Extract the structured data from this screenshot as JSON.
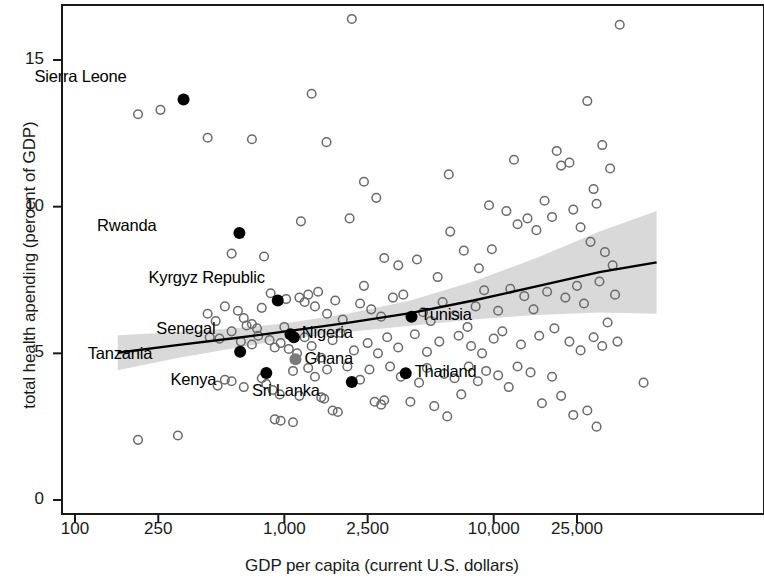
{
  "chart_data": {
    "type": "scatter",
    "title": "",
    "xlabel": "GDP per capita (current U.S. dollars)",
    "ylabel": "total health apending (percent of GDP)",
    "xscale": "log",
    "yscale": "linear",
    "xlim": [
      130,
      60000
    ],
    "ylim": [
      0,
      17.4
    ],
    "xticks": [
      100,
      250,
      1000,
      2500,
      10000,
      25000
    ],
    "xtick_labels": [
      "100",
      "250",
      "1,000",
      "2,500",
      "10,000",
      "25,000"
    ],
    "yticks": [
      0,
      5,
      10,
      15
    ],
    "ytick_labels": [
      "0",
      "5",
      "10",
      "15"
    ],
    "grid": false,
    "legend": "none",
    "colors": {
      "highlight_point": "#000000",
      "other_point_stroke": "#6a6a6a",
      "ghana_point": "#7a7a7a",
      "trend_line": "#000000",
      "confidence_band": "#d9d9d9",
      "axis": "#1a1a1a"
    },
    "series": [
      {
        "name": "highlighted countries",
        "marker": "filled-circle",
        "points": [
          {
            "label": "Sierra Leone",
            "x": 330,
            "y": 13.65,
            "label_dx": -57,
            "label_dy": -22
          },
          {
            "label": "Rwanda",
            "x": 610,
            "y": 9.1,
            "label_dx": -83,
            "label_dy": -6
          },
          {
            "label": "Kyrgyz Republic",
            "x": 930,
            "y": 6.8,
            "label_dx": -13,
            "label_dy": -22
          },
          {
            "label": "Senegal",
            "x": 1070,
            "y": 5.65,
            "label_dx": -75,
            "label_dy": -4
          },
          {
            "label": "Nigeria",
            "x": 1110,
            "y": 5.55,
            "label_dx": 8,
            "label_dy": -3
          },
          {
            "label": "Tanzania",
            "x": 615,
            "y": 5.05,
            "label_dx": -88,
            "label_dy": 3
          },
          {
            "label": "Ghana",
            "x": 1130,
            "y": 4.8,
            "label_dx": 9,
            "label_dy": 1,
            "fill": "gray"
          },
          {
            "label": "Kenya",
            "x": 820,
            "y": 4.33,
            "label_dx": -50,
            "label_dy": 8
          },
          {
            "label": "Sri Lanka",
            "x": 2100,
            "y": 4.02,
            "label_dx": -32,
            "label_dy": 10
          },
          {
            "label": "Tunisia",
            "x": 4050,
            "y": 6.25,
            "label_dx": 9,
            "label_dy": -1
          },
          {
            "label": "Thailand",
            "x": 3800,
            "y": 4.32,
            "label_dx": 9,
            "label_dy": 0
          }
        ]
      },
      {
        "name": "other countries",
        "marker": "open-circle",
        "points": [
          {
            "x": 200,
            "y": 13.15
          },
          {
            "x": 256,
            "y": 13.3
          },
          {
            "x": 430,
            "y": 12.35
          },
          {
            "x": 700,
            "y": 12.3
          },
          {
            "x": 1350,
            "y": 13.85
          },
          {
            "x": 1590,
            "y": 12.2
          },
          {
            "x": 2100,
            "y": 16.4
          },
          {
            "x": 2400,
            "y": 10.85
          },
          {
            "x": 2750,
            "y": 10.3
          },
          {
            "x": 6100,
            "y": 11.1
          },
          {
            "x": 9500,
            "y": 10.05
          },
          {
            "x": 12500,
            "y": 11.6
          },
          {
            "x": 20000,
            "y": 11.9
          },
          {
            "x": 21000,
            "y": 11.4
          },
          {
            "x": 23000,
            "y": 11.5
          },
          {
            "x": 28000,
            "y": 13.6
          },
          {
            "x": 30000,
            "y": 10.6
          },
          {
            "x": 31000,
            "y": 10.1
          },
          {
            "x": 33000,
            "y": 12.1
          },
          {
            "x": 36000,
            "y": 11.3
          },
          {
            "x": 40000,
            "y": 16.2
          },
          {
            "x": 560,
            "y": 8.4
          },
          {
            "x": 800,
            "y": 8.3
          },
          {
            "x": 1200,
            "y": 9.5
          },
          {
            "x": 1450,
            "y": 7.1
          },
          {
            "x": 2050,
            "y": 9.6
          },
          {
            "x": 2400,
            "y": 7.3
          },
          {
            "x": 3000,
            "y": 8.25
          },
          {
            "x": 3500,
            "y": 8.0
          },
          {
            "x": 4300,
            "y": 8.2
          },
          {
            "x": 5400,
            "y": 7.6
          },
          {
            "x": 6200,
            "y": 9.15
          },
          {
            "x": 7200,
            "y": 8.5
          },
          {
            "x": 8500,
            "y": 7.9
          },
          {
            "x": 9800,
            "y": 8.55
          },
          {
            "x": 11500,
            "y": 9.85
          },
          {
            "x": 13000,
            "y": 9.4
          },
          {
            "x": 14500,
            "y": 9.6
          },
          {
            "x": 16000,
            "y": 9.2
          },
          {
            "x": 17500,
            "y": 10.2
          },
          {
            "x": 19000,
            "y": 9.65
          },
          {
            "x": 24000,
            "y": 9.9
          },
          {
            "x": 26000,
            "y": 9.3
          },
          {
            "x": 29000,
            "y": 8.8
          },
          {
            "x": 34000,
            "y": 8.45
          },
          {
            "x": 37000,
            "y": 8.0
          },
          {
            "x": 430,
            "y": 6.35
          },
          {
            "x": 470,
            "y": 6.1
          },
          {
            "x": 520,
            "y": 6.6
          },
          {
            "x": 600,
            "y": 6.45
          },
          {
            "x": 640,
            "y": 6.2
          },
          {
            "x": 660,
            "y": 5.95
          },
          {
            "x": 700,
            "y": 6.0
          },
          {
            "x": 740,
            "y": 5.85
          },
          {
            "x": 780,
            "y": 6.55
          },
          {
            "x": 860,
            "y": 7.05
          },
          {
            "x": 1020,
            "y": 6.85
          },
          {
            "x": 1180,
            "y": 6.9
          },
          {
            "x": 1250,
            "y": 6.75
          },
          {
            "x": 1300,
            "y": 7.0
          },
          {
            "x": 1400,
            "y": 6.6
          },
          {
            "x": 1600,
            "y": 6.35
          },
          {
            "x": 1750,
            "y": 6.8
          },
          {
            "x": 1900,
            "y": 6.15
          },
          {
            "x": 2300,
            "y": 6.7
          },
          {
            "x": 2600,
            "y": 6.5
          },
          {
            "x": 2900,
            "y": 6.25
          },
          {
            "x": 3300,
            "y": 6.9
          },
          {
            "x": 3700,
            "y": 7.0
          },
          {
            "x": 4600,
            "y": 6.4
          },
          {
            "x": 5000,
            "y": 6.1
          },
          {
            "x": 5700,
            "y": 6.75
          },
          {
            "x": 6500,
            "y": 6.3
          },
          {
            "x": 7500,
            "y": 5.9
          },
          {
            "x": 8200,
            "y": 6.6
          },
          {
            "x": 9000,
            "y": 7.15
          },
          {
            "x": 10500,
            "y": 6.45
          },
          {
            "x": 12000,
            "y": 7.2
          },
          {
            "x": 14000,
            "y": 6.95
          },
          {
            "x": 15500,
            "y": 6.5
          },
          {
            "x": 18000,
            "y": 7.1
          },
          {
            "x": 22000,
            "y": 6.9
          },
          {
            "x": 25000,
            "y": 7.3
          },
          {
            "x": 27000,
            "y": 6.7
          },
          {
            "x": 32000,
            "y": 7.45
          },
          {
            "x": 35000,
            "y": 6.05
          },
          {
            "x": 38000,
            "y": 7.0
          },
          {
            "x": 440,
            "y": 5.55
          },
          {
            "x": 490,
            "y": 5.5
          },
          {
            "x": 560,
            "y": 5.75
          },
          {
            "x": 620,
            "y": 5.4
          },
          {
            "x": 700,
            "y": 5.3
          },
          {
            "x": 750,
            "y": 5.6
          },
          {
            "x": 850,
            "y": 5.45
          },
          {
            "x": 900,
            "y": 5.2
          },
          {
            "x": 960,
            "y": 5.35
          },
          {
            "x": 1000,
            "y": 5.9
          },
          {
            "x": 1050,
            "y": 5.15
          },
          {
            "x": 1150,
            "y": 5.0
          },
          {
            "x": 1250,
            "y": 5.55
          },
          {
            "x": 1350,
            "y": 5.25
          },
          {
            "x": 1500,
            "y": 4.85
          },
          {
            "x": 1700,
            "y": 5.45
          },
          {
            "x": 1850,
            "y": 5.7
          },
          {
            "x": 2150,
            "y": 5.1
          },
          {
            "x": 2500,
            "y": 5.35
          },
          {
            "x": 2800,
            "y": 5.0
          },
          {
            "x": 3100,
            "y": 5.55
          },
          {
            "x": 3500,
            "y": 5.2
          },
          {
            "x": 4200,
            "y": 5.65
          },
          {
            "x": 4800,
            "y": 5.05
          },
          {
            "x": 5500,
            "y": 5.4
          },
          {
            "x": 6800,
            "y": 5.6
          },
          {
            "x": 7800,
            "y": 5.25
          },
          {
            "x": 8800,
            "y": 5.0
          },
          {
            "x": 10000,
            "y": 5.5
          },
          {
            "x": 11000,
            "y": 5.75
          },
          {
            "x": 13500,
            "y": 5.3
          },
          {
            "x": 16500,
            "y": 5.6
          },
          {
            "x": 19500,
            "y": 5.85
          },
          {
            "x": 23000,
            "y": 5.4
          },
          {
            "x": 26000,
            "y": 5.1
          },
          {
            "x": 30000,
            "y": 5.55
          },
          {
            "x": 33000,
            "y": 5.25
          },
          {
            "x": 39000,
            "y": 5.4
          },
          {
            "x": 780,
            "y": 4.15
          },
          {
            "x": 820,
            "y": 3.95
          },
          {
            "x": 880,
            "y": 3.75
          },
          {
            "x": 950,
            "y": 3.6
          },
          {
            "x": 1100,
            "y": 4.4
          },
          {
            "x": 1180,
            "y": 3.55
          },
          {
            "x": 1300,
            "y": 4.5
          },
          {
            "x": 1400,
            "y": 4.2
          },
          {
            "x": 1500,
            "y": 3.5
          },
          {
            "x": 1600,
            "y": 4.45
          },
          {
            "x": 1700,
            "y": 3.05
          },
          {
            "x": 1800,
            "y": 3.0
          },
          {
            "x": 2000,
            "y": 4.55
          },
          {
            "x": 2300,
            "y": 4.1
          },
          {
            "x": 2550,
            "y": 4.45
          },
          {
            "x": 2700,
            "y": 3.35
          },
          {
            "x": 3000,
            "y": 3.4
          },
          {
            "x": 3200,
            "y": 4.55
          },
          {
            "x": 3600,
            "y": 4.2
          },
          {
            "x": 4000,
            "y": 3.35
          },
          {
            "x": 4400,
            "y": 4.0
          },
          {
            "x": 4800,
            "y": 4.5
          },
          {
            "x": 5200,
            "y": 3.2
          },
          {
            "x": 5800,
            "y": 4.3
          },
          {
            "x": 6500,
            "y": 4.15
          },
          {
            "x": 7000,
            "y": 3.6
          },
          {
            "x": 7600,
            "y": 4.55
          },
          {
            "x": 8400,
            "y": 4.05
          },
          {
            "x": 9200,
            "y": 4.4
          },
          {
            "x": 10500,
            "y": 4.25
          },
          {
            "x": 11800,
            "y": 3.85
          },
          {
            "x": 13000,
            "y": 4.55
          },
          {
            "x": 15000,
            "y": 4.35
          },
          {
            "x": 17000,
            "y": 3.3
          },
          {
            "x": 19000,
            "y": 4.2
          },
          {
            "x": 21000,
            "y": 3.55
          },
          {
            "x": 24000,
            "y": 2.9
          },
          {
            "x": 28000,
            "y": 3.05
          },
          {
            "x": 31000,
            "y": 2.5
          },
          {
            "x": 52000,
            "y": 4.0
          },
          {
            "x": 200,
            "y": 2.05
          },
          {
            "x": 310,
            "y": 2.2
          },
          {
            "x": 480,
            "y": 3.9
          },
          {
            "x": 520,
            "y": 4.1
          },
          {
            "x": 560,
            "y": 4.05
          },
          {
            "x": 640,
            "y": 3.85
          },
          {
            "x": 900,
            "y": 2.75
          },
          {
            "x": 960,
            "y": 2.7
          },
          {
            "x": 1100,
            "y": 2.65
          },
          {
            "x": 1550,
            "y": 3.45
          },
          {
            "x": 2900,
            "y": 3.25
          },
          {
            "x": 6000,
            "y": 2.85
          }
        ]
      }
    ],
    "trend_line": {
      "name": "fitted trend",
      "points": [
        {
          "x": 160,
          "y": 5.02
        },
        {
          "x": 300,
          "y": 5.27
        },
        {
          "x": 600,
          "y": 5.53
        },
        {
          "x": 1000,
          "y": 5.74
        },
        {
          "x": 2000,
          "y": 6.04
        },
        {
          "x": 4000,
          "y": 6.37
        },
        {
          "x": 8000,
          "y": 6.8
        },
        {
          "x": 16000,
          "y": 7.28
        },
        {
          "x": 32000,
          "y": 7.77
        },
        {
          "x": 60000,
          "y": 8.1
        }
      ]
    },
    "confidence_band": {
      "name": "confidence interval",
      "upper": [
        {
          "x": 160,
          "y": 5.62
        },
        {
          "x": 300,
          "y": 5.72
        },
        {
          "x": 600,
          "y": 5.86
        },
        {
          "x": 1000,
          "y": 6.02
        },
        {
          "x": 2000,
          "y": 6.35
        },
        {
          "x": 4000,
          "y": 6.8
        },
        {
          "x": 8000,
          "y": 7.45
        },
        {
          "x": 16000,
          "y": 8.25
        },
        {
          "x": 32000,
          "y": 9.15
        },
        {
          "x": 60000,
          "y": 9.85
        }
      ],
      "lower": [
        {
          "x": 160,
          "y": 4.42
        },
        {
          "x": 300,
          "y": 4.82
        },
        {
          "x": 600,
          "y": 5.2
        },
        {
          "x": 1000,
          "y": 5.46
        },
        {
          "x": 2000,
          "y": 5.73
        },
        {
          "x": 4000,
          "y": 5.94
        },
        {
          "x": 8000,
          "y": 6.15
        },
        {
          "x": 16000,
          "y": 6.31
        },
        {
          "x": 32000,
          "y": 6.39
        },
        {
          "x": 60000,
          "y": 6.35
        }
      ]
    }
  }
}
